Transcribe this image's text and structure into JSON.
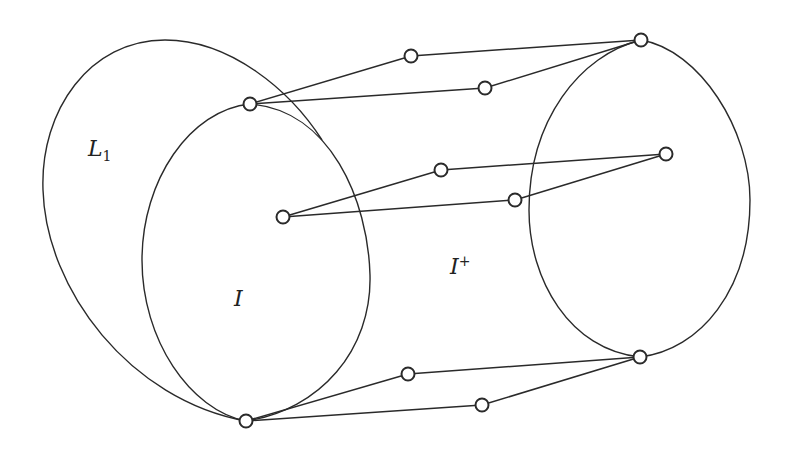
{
  "diagram": {
    "labels": {
      "L1": {
        "main": "L",
        "sub": "1"
      },
      "I": {
        "main": "I"
      },
      "I_plus": {
        "main": "I",
        "sup": "+"
      }
    },
    "regions": [
      "L1",
      "I",
      "I+",
      "right-ellipse"
    ],
    "nodes": [
      {
        "id": "a",
        "x": 250,
        "y": 104
      },
      {
        "id": "b",
        "x": 411,
        "y": 56
      },
      {
        "id": "c",
        "x": 485,
        "y": 88
      },
      {
        "id": "d",
        "x": 641,
        "y": 40
      },
      {
        "id": "e",
        "x": 283,
        "y": 217
      },
      {
        "id": "f",
        "x": 441,
        "y": 170
      },
      {
        "id": "g",
        "x": 515,
        "y": 200
      },
      {
        "id": "h",
        "x": 666,
        "y": 154
      },
      {
        "id": "i",
        "x": 246,
        "y": 421
      },
      {
        "id": "j",
        "x": 408,
        "y": 374
      },
      {
        "id": "k",
        "x": 482,
        "y": 405
      },
      {
        "id": "l",
        "x": 640,
        "y": 357
      }
    ],
    "edges": [
      [
        "a",
        "b"
      ],
      [
        "b",
        "d"
      ],
      [
        "a",
        "c"
      ],
      [
        "c",
        "d"
      ],
      [
        "e",
        "f"
      ],
      [
        "f",
        "h"
      ],
      [
        "e",
        "g"
      ],
      [
        "g",
        "h"
      ],
      [
        "i",
        "j"
      ],
      [
        "j",
        "l"
      ],
      [
        "i",
        "k"
      ],
      [
        "k",
        "l"
      ]
    ],
    "colors": {
      "stroke": "#2a2a2a",
      "background": "#ffffff"
    }
  }
}
